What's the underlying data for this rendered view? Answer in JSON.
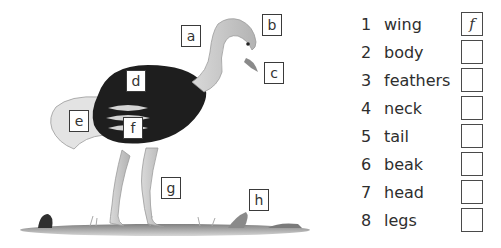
{
  "illustration": {
    "subject": "ostrich",
    "labels": [
      {
        "letter": "a",
        "x": 181,
        "y": 25
      },
      {
        "letter": "b",
        "x": 262,
        "y": 14
      },
      {
        "letter": "c",
        "x": 264,
        "y": 62
      },
      {
        "letter": "d",
        "x": 126,
        "y": 70
      },
      {
        "letter": "e",
        "x": 69,
        "y": 110
      },
      {
        "letter": "f",
        "x": 123,
        "y": 117
      },
      {
        "letter": "g",
        "x": 161,
        "y": 177
      },
      {
        "letter": "h",
        "x": 249,
        "y": 189
      }
    ]
  },
  "matching_list": {
    "items": [
      {
        "number": "1",
        "word": "wing",
        "answer": "f"
      },
      {
        "number": "2",
        "word": "body",
        "answer": ""
      },
      {
        "number": "3",
        "word": "feathers",
        "answer": ""
      },
      {
        "number": "4",
        "word": "neck",
        "answer": ""
      },
      {
        "number": "5",
        "word": "tail",
        "answer": ""
      },
      {
        "number": "6",
        "word": "beak",
        "answer": ""
      },
      {
        "number": "7",
        "word": "head",
        "answer": ""
      },
      {
        "number": "8",
        "word": "legs",
        "answer": ""
      }
    ]
  }
}
